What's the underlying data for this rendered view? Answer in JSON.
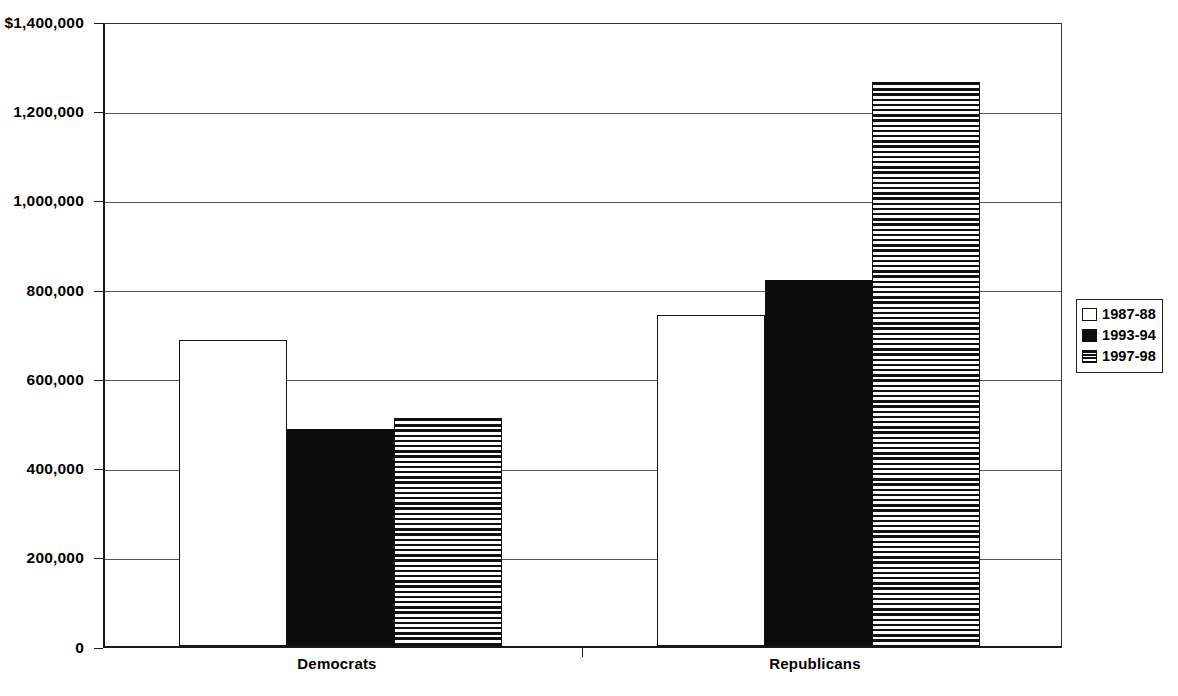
{
  "chart_data": {
    "type": "bar",
    "title": "",
    "subtitle": "",
    "xlabel": "",
    "ylabel": "",
    "categories": [
      "Democrats",
      "Republicans"
    ],
    "series": [
      {
        "name": "1987-88",
        "fill": "open",
        "values": [
          689000,
          744000
        ]
      },
      {
        "name": "1993-94",
        "fill": "solid",
        "values": [
          489000,
          824000
        ]
      },
      {
        "name": "1997-98",
        "fill": "hstripe",
        "values": [
          513000,
          1270000
        ]
      }
    ],
    "ylim": [
      0,
      1400000
    ],
    "ytick_values": [
      0,
      200000,
      400000,
      600000,
      800000,
      1000000,
      1200000,
      1400000
    ],
    "ytick_labels": [
      "0",
      "200,000",
      "400,000",
      "600,000",
      "800,000",
      "1,000,000",
      "1,200,000",
      "$1,400,000"
    ],
    "grid": true,
    "grid_axis": "y",
    "legend_position": "right",
    "colors": {
      "axis": "#1a1a1a",
      "gridline": "#555555",
      "bar_outline": "#111111",
      "bar_solid": "#0d0d0d",
      "background": "#ffffff"
    }
  },
  "legend": {
    "items": [
      {
        "label": "1987-88",
        "fill": "open"
      },
      {
        "label": "1993-94",
        "fill": "solid"
      },
      {
        "label": "1997-98",
        "fill": "hstripe"
      }
    ]
  },
  "axis": {
    "category_labels": [
      "Democrats",
      "Republicans"
    ],
    "value_labels": [
      "$1,400,000",
      "1,200,000",
      "1,000,000",
      "800,000",
      "600,000",
      "400,000",
      "200,000",
      "0"
    ]
  }
}
